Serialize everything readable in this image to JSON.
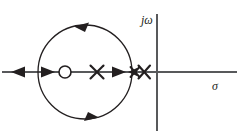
{
  "figure": {
    "kind": "root-locus-plot",
    "width": 239,
    "height": 135,
    "background_color": "#ffffff",
    "stroke_color": "#231f20",
    "axis_color": "#58595b"
  },
  "axes": {
    "real": {
      "label": "σ",
      "name": "sigma-axis",
      "y": 72,
      "x_start": 2,
      "x_end": 237,
      "label_x": 213,
      "label_y": 88
    },
    "imaginary": {
      "label": "jω",
      "name": "j-omega-axis",
      "x": 157,
      "y_start": 14,
      "y_end": 131,
      "label_x": 141,
      "label_y": 13
    },
    "origin": {
      "x": 157,
      "y": 72
    }
  },
  "locus_circle": {
    "center_x": 85,
    "center_y": 72,
    "radius": 47,
    "direction": "counterclockwise"
  },
  "zeros": [
    {
      "label": "zero",
      "x": 65,
      "y": 72,
      "radius": 6
    }
  ],
  "poles": [
    {
      "label": "pole-1",
      "x": 97,
      "y": 72,
      "size": 7
    },
    {
      "label": "pole-2",
      "x": 135,
      "y": 72,
      "size": 6
    },
    {
      "label": "pole-3",
      "x": 144,
      "y": 72,
      "size": 7
    }
  ],
  "locus_arrows": [
    {
      "name": "real-axis-arrow-left",
      "x": 18,
      "y": 72,
      "dir": "left"
    },
    {
      "name": "real-axis-arrow-right-1",
      "x": 48,
      "y": 72,
      "dir": "right"
    },
    {
      "name": "real-axis-arrow-right-2",
      "x": 119,
      "y": 72,
      "dir": "right"
    },
    {
      "name": "real-axis-arrow-left-2",
      "x": 134,
      "y": 72,
      "dir": "left"
    },
    {
      "name": "circle-arrow-top",
      "x": 82,
      "y": 25,
      "dir": "left"
    },
    {
      "name": "circle-arrow-bottom",
      "x": 91,
      "y": 119,
      "dir": "right"
    }
  ],
  "legend": {
    "zero_symbol": "O",
    "pole_symbol": "X"
  }
}
